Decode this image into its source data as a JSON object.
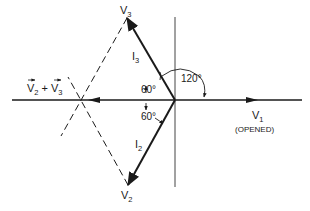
{
  "diagram": {
    "type": "phasor-diagram",
    "labels": {
      "v3": "V",
      "v3_sub": "3",
      "v2": "V",
      "v2_sub": "2",
      "v1": "V",
      "v1_sub": "1",
      "v1_note": "(OPENED)",
      "i3": "I",
      "i3_sub": "3",
      "i2": "I",
      "i2_sub": "2",
      "sum_v2": "V",
      "sum_v2_sub": "2",
      "sum_plus": "+",
      "sum_v3": "V",
      "sum_v3_sub": "3",
      "angle_120": "120°",
      "angle_60_upper": "60°",
      "angle_60_lower": "60°"
    },
    "colors": {
      "ink": "#1a1a1a",
      "background": "#ffffff"
    }
  }
}
